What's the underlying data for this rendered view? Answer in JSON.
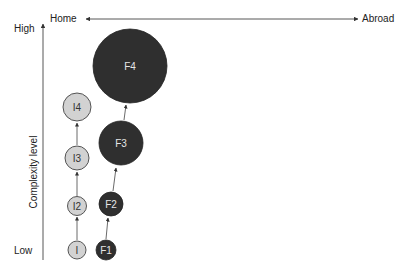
{
  "diagram": {
    "x_axis": {
      "left_label": "Home",
      "right_label": "Abroad"
    },
    "y_axis": {
      "title": "Complexity level",
      "high_label": "High",
      "low_label": "Low"
    },
    "colors": {
      "light_fill": "#d2d2d2",
      "light_stroke": "#444444",
      "dark_fill": "#2f2f2f",
      "line": "#333333"
    },
    "nodes": {
      "i1": {
        "label": "I"
      },
      "i2": {
        "label": "I2"
      },
      "i3": {
        "label": "I3"
      },
      "i4": {
        "label": "I4"
      },
      "f1": {
        "label": "F1"
      },
      "f2": {
        "label": "F2"
      },
      "f3": {
        "label": "F3"
      },
      "f4": {
        "label": "F4"
      }
    }
  }
}
